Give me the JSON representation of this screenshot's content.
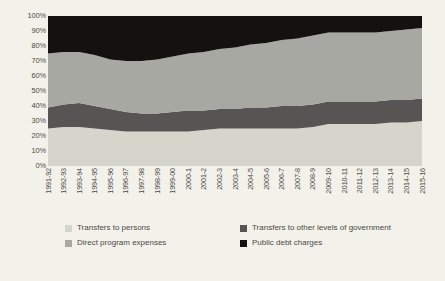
{
  "chart_data": {
    "type": "area",
    "title": "",
    "subtitle": "",
    "xlabel": "",
    "ylabel": "",
    "ylim": [
      0,
      100
    ],
    "stacked": "100%",
    "grid": false,
    "legend_position": "bottom",
    "yticks": [
      "0%",
      "10%",
      "20%",
      "30%",
      "40%",
      "50%",
      "60%",
      "70%",
      "80%",
      "90%",
      "100%"
    ],
    "categories": [
      "1991-92",
      "1992-93",
      "1993-94",
      "1994-95",
      "1995-96",
      "1996-97",
      "1997-98",
      "1998-99",
      "1999-00",
      "2000-1",
      "2001-2",
      "2002-3",
      "2003-4",
      "2004-5",
      "2005-6",
      "2006-7",
      "2007-8",
      "2008-9",
      "2009-10",
      "2010-11",
      "2011-12",
      "2012-13",
      "2013-14",
      "2014-15",
      "2015-16"
    ],
    "series": [
      {
        "name": "Transfers to persons",
        "color": "#d6d5cc",
        "values": [
          25,
          26,
          26,
          25,
          24,
          23,
          23,
          23,
          23,
          23,
          24,
          25,
          25,
          25,
          25,
          25,
          25,
          26,
          28,
          28,
          28,
          28,
          29,
          29,
          30
        ]
      },
      {
        "name": "Transfers to other levels of government",
        "color": "#565553",
        "values": [
          14,
          15,
          16,
          15,
          14,
          13,
          12,
          12,
          13,
          14,
          13,
          13,
          13,
          14,
          14,
          15,
          15,
          15,
          15,
          15,
          15,
          15,
          15,
          15,
          15
        ]
      },
      {
        "name": "Direct program expenses",
        "color": "#a8a8a2",
        "values": [
          36,
          35,
          34,
          34,
          33,
          34,
          35,
          36,
          37,
          38,
          39,
          40,
          41,
          42,
          43,
          44,
          45,
          46,
          46,
          46,
          46,
          46,
          46,
          47,
          47
        ]
      },
      {
        "name": "Public debt charges",
        "color": "#14120f",
        "values": [
          25,
          24,
          24,
          26,
          29,
          30,
          30,
          29,
          27,
          25,
          24,
          22,
          21,
          19,
          18,
          16,
          15,
          13,
          11,
          11,
          11,
          11,
          10,
          9,
          8
        ]
      }
    ]
  },
  "legend": {
    "items": [
      {
        "label": "Transfers to persons",
        "color": "#d6d5cc"
      },
      {
        "label": "Direct program expenses",
        "color": "#a8a8a2"
      },
      {
        "label": "Transfers to other levels of government",
        "color": "#565553"
      },
      {
        "label": "Public debt charges",
        "color": "#14120f"
      }
    ]
  },
  "colors": {
    "background": "#f2f1ea",
    "text": "#4c4a45",
    "plot_background": "#d6d5cc"
  }
}
